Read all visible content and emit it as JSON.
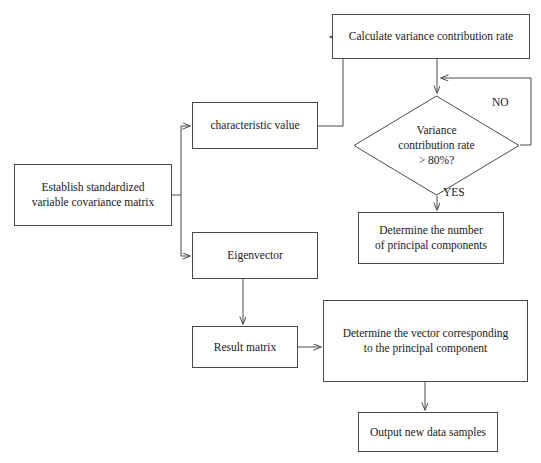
{
  "diagram": {
    "type": "flowchart",
    "background_color": "#ffffff",
    "line_color": "#4a4a4a",
    "text_color": "#1a1a1a",
    "nodes": [
      {
        "id": "establish",
        "shape": "rectangle",
        "label": "Establish standardized\nvariable covariance matrix",
        "x": 14,
        "y": 164,
        "w": 158,
        "h": 62
      },
      {
        "id": "characteristic_value",
        "shape": "rectangle",
        "label": "characteristic value",
        "x": 192,
        "y": 102,
        "w": 126,
        "h": 47
      },
      {
        "id": "calculate_variance",
        "shape": "rectangle",
        "label": "Calculate variance contribution rate",
        "x": 332,
        "y": 14,
        "w": 198,
        "h": 45
      },
      {
        "id": "variance_decision",
        "shape": "diamond",
        "label": "Variance\ncontribution rate\n> 80%?",
        "x": 353,
        "y": 95,
        "w": 167,
        "h": 101
      },
      {
        "id": "determine_number",
        "shape": "rectangle",
        "label": "Determine the number\nof principal components",
        "x": 358,
        "y": 212,
        "w": 146,
        "h": 52
      },
      {
        "id": "eigenvector",
        "shape": "rectangle",
        "label": "Eigenvector",
        "x": 192,
        "y": 232,
        "w": 126,
        "h": 47
      },
      {
        "id": "result_matrix",
        "shape": "rectangle",
        "label": "Result matrix",
        "x": 192,
        "y": 326,
        "w": 106,
        "h": 42
      },
      {
        "id": "determine_vector",
        "shape": "rectangle",
        "label": "Determine the vector corresponding\nto the principal component",
        "x": 323,
        "y": 300,
        "w": 205,
        "h": 82
      },
      {
        "id": "output_samples",
        "shape": "rectangle",
        "label": "Output new data samples",
        "x": 358,
        "y": 412,
        "w": 140,
        "h": 40
      }
    ],
    "edge_labels": [
      {
        "id": "no",
        "text": "NO",
        "x": 492,
        "y": 96
      },
      {
        "id": "yes",
        "text": "YES",
        "x": 443,
        "y": 186
      }
    ],
    "edges": [
      {
        "from": "establish",
        "to": "characteristic_value",
        "label": ""
      },
      {
        "from": "establish",
        "to": "eigenvector",
        "label": ""
      },
      {
        "from": "characteristic_value",
        "to": "calculate_variance",
        "label": ""
      },
      {
        "from": "calculate_variance",
        "to": "variance_decision",
        "label": ""
      },
      {
        "from": "variance_decision",
        "to": "calculate_variance",
        "label": "NO"
      },
      {
        "from": "variance_decision",
        "to": "determine_number",
        "label": "YES"
      },
      {
        "from": "eigenvector",
        "to": "result_matrix",
        "label": ""
      },
      {
        "from": "result_matrix",
        "to": "determine_vector",
        "label": ""
      },
      {
        "from": "determine_vector",
        "to": "output_samples",
        "label": ""
      }
    ]
  }
}
